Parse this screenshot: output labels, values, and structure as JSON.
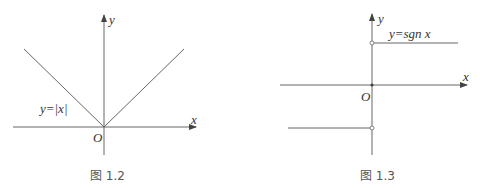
{
  "figures": [
    {
      "caption": "图 1.2",
      "function_label": "y=|x|",
      "x_axis_label": "x",
      "y_axis_label": "y",
      "origin_label": "O"
    },
    {
      "caption": "图 1.3",
      "function_label": "y=sgn x",
      "x_axis_label": "x",
      "y_axis_label": "y",
      "origin_label": "O"
    }
  ],
  "colors": {
    "line": "#555555",
    "text": "#333333"
  }
}
